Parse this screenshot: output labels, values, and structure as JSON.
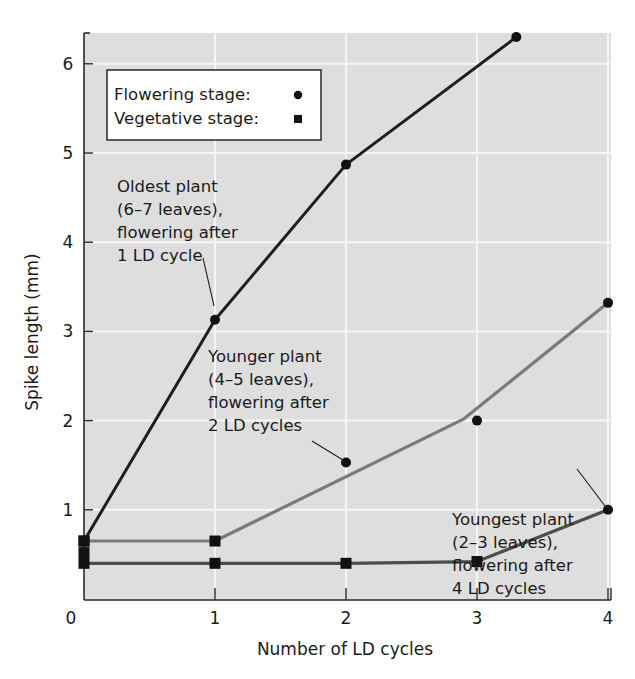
{
  "chart_data": {
    "type": "line",
    "title": "",
    "xlabel": "Number of LD cycles",
    "ylabel": "Spike length (mm)",
    "xlim": [
      0,
      4
    ],
    "ylim": [
      0,
      6.3
    ],
    "x_ticks": [
      "0",
      "1",
      "2",
      "3",
      "4"
    ],
    "y_ticks": [
      "1",
      "2",
      "3",
      "4",
      "5",
      "6"
    ],
    "grid": true,
    "legend_position": "upper-left",
    "legend": [
      {
        "label": "Flowering stage:",
        "marker": "circle"
      },
      {
        "label": "Vegetative stage:",
        "marker": "square"
      }
    ],
    "series": [
      {
        "name": "Oldest plant (6–7 leaves), flowering after 1 LD cycle",
        "color": "#1e1e1e",
        "points": [
          {
            "x": 0,
            "y": 0.65,
            "marker": "square"
          },
          {
            "x": 1,
            "y": 3.13,
            "marker": "circle"
          },
          {
            "x": 2,
            "y": 4.87,
            "marker": "circle"
          },
          {
            "x": 3.3,
            "y": 6.3,
            "marker": "circle"
          }
        ]
      },
      {
        "name": "Younger plant (4–5 leaves), flowering after 2 LD cycles",
        "color": "#7a7a7a",
        "points": [
          {
            "x": 0,
            "y": 0.65,
            "marker": "square"
          },
          {
            "x": 1,
            "y": 0.65,
            "marker": "square"
          },
          {
            "x": 2.9,
            "y": 2.02,
            "marker": "none"
          },
          {
            "x": 4,
            "y": 3.32,
            "marker": "circle"
          }
        ],
        "scatter_points": [
          {
            "x": 2,
            "y": 1.53,
            "marker": "circle"
          },
          {
            "x": 3,
            "y": 2.0,
            "marker": "circle"
          }
        ]
      },
      {
        "name": "Youngest plant (2–3 leaves), flowering after 4 LD cycles",
        "color": "#4d4d4d",
        "points": [
          {
            "x": 0,
            "y": 0.4,
            "marker": "square"
          },
          {
            "x": 1,
            "y": 0.4,
            "marker": "square"
          },
          {
            "x": 2,
            "y": 0.4,
            "marker": "square"
          },
          {
            "x": 3,
            "y": 0.42,
            "marker": "square"
          },
          {
            "x": 4,
            "y": 1.0,
            "marker": "circle"
          }
        ]
      }
    ],
    "extra_points": [
      {
        "x": 0,
        "y": 0.52,
        "marker": "square"
      }
    ],
    "annotations": [
      {
        "lines": [
          "Oldest plant",
          "(6–7 leaves),",
          "flowering after",
          "1 LD cycle"
        ],
        "points_to": {
          "x": 1,
          "y": 3.13
        }
      },
      {
        "lines": [
          "Younger plant",
          "(4–5 leaves),",
          "flowering after",
          "2 LD cycles"
        ],
        "points_to": {
          "x": 2,
          "y": 1.53
        }
      },
      {
        "lines": [
          "Youngest plant",
          "(2–3 leaves),",
          "flowering after",
          "4 LD cycles"
        ],
        "points_to": {
          "x": 4,
          "y": 1.0
        }
      }
    ]
  },
  "style": {
    "plot_bg": "#dedede",
    "grid_color": "#f6f6f6",
    "axis_color": "#2a2a2a",
    "marker_color": "#111111"
  }
}
